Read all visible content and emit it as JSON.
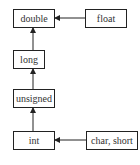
{
  "diagram": {
    "title": "",
    "nodes": [
      {
        "id": "double",
        "label": "double"
      },
      {
        "id": "float",
        "label": "float"
      },
      {
        "id": "long",
        "label": "long"
      },
      {
        "id": "unsigned",
        "label": "unsigned"
      },
      {
        "id": "int",
        "label": "int"
      },
      {
        "id": "char_short",
        "label": "char, short"
      }
    ],
    "edges": [
      {
        "from": "float",
        "to": "double"
      },
      {
        "from": "long",
        "to": "double"
      },
      {
        "from": "unsigned",
        "to": "long"
      },
      {
        "from": "int",
        "to": "unsigned"
      },
      {
        "from": "char_short",
        "to": "int"
      }
    ]
  }
}
